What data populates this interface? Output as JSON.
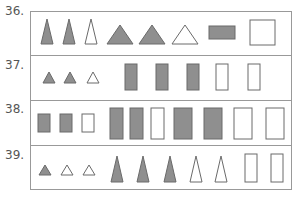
{
  "colors": {
    "fill": "#8f8f8f",
    "stroke": "#6a6a6a",
    "empty": "#ffffff",
    "border": "#999999"
  },
  "rows": [
    {
      "number": "36.",
      "shapes": [
        {
          "type": "tall-triangle",
          "filled": true
        },
        {
          "type": "tall-triangle",
          "filled": true
        },
        {
          "type": "tall-triangle",
          "filled": false
        },
        {
          "type": "wide-triangle",
          "filled": true
        },
        {
          "type": "wide-triangle",
          "filled": true
        },
        {
          "type": "wide-triangle",
          "filled": false
        },
        {
          "type": "wide-rectangle",
          "filled": true
        },
        {
          "type": "square",
          "filled": false
        }
      ]
    },
    {
      "number": "37.",
      "shapes": [
        {
          "type": "small-triangle",
          "filled": true
        },
        {
          "type": "small-triangle",
          "filled": true
        },
        {
          "type": "small-triangle",
          "filled": false
        },
        {
          "type": "tall-rectangle",
          "filled": true
        },
        {
          "type": "tall-rectangle",
          "filled": true
        },
        {
          "type": "tall-rectangle",
          "filled": true
        },
        {
          "type": "tall-rectangle",
          "filled": false
        },
        {
          "type": "tall-rectangle",
          "filled": false
        }
      ]
    },
    {
      "number": "38.",
      "shapes": [
        {
          "type": "small-rectangle",
          "filled": true
        },
        {
          "type": "small-rectangle",
          "filled": true
        },
        {
          "type": "small-rectangle",
          "filled": false
        },
        {
          "type": "large-rectangle",
          "filled": true
        },
        {
          "type": "large-rectangle",
          "filled": true
        },
        {
          "type": "large-rectangle",
          "filled": false
        },
        {
          "type": "large-rectangle",
          "filled": true
        },
        {
          "type": "large-rectangle",
          "filled": true
        },
        {
          "type": "large-rectangle",
          "filled": false
        },
        {
          "type": "large-rectangle",
          "filled": false
        }
      ]
    },
    {
      "number": "39.",
      "shapes": [
        {
          "type": "small-triangle",
          "filled": true
        },
        {
          "type": "small-triangle",
          "filled": false
        },
        {
          "type": "small-triangle",
          "filled": false
        },
        {
          "type": "tall-triangle",
          "filled": true
        },
        {
          "type": "tall-triangle",
          "filled": true
        },
        {
          "type": "tall-triangle",
          "filled": true
        },
        {
          "type": "tall-triangle",
          "filled": false
        },
        {
          "type": "tall-triangle",
          "filled": false
        },
        {
          "type": "tall-rectangle",
          "filled": false
        },
        {
          "type": "tall-rectangle",
          "filled": false
        }
      ]
    }
  ]
}
